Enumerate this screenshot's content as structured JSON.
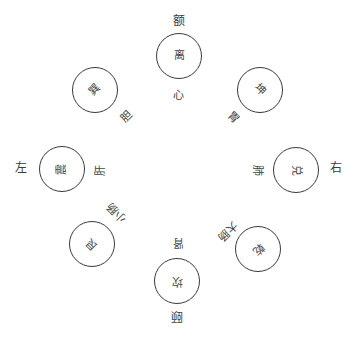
{
  "diagram": {
    "type": "bagua-organ-map",
    "line_color": "#3a3a3a",
    "text_color": "#444444",
    "trigrams": [
      {
        "id": "li",
        "label": "离",
        "position": "top",
        "x": 179,
        "y": 56,
        "rotation": 0
      },
      {
        "id": "kun",
        "label": "坤",
        "position": "top-right",
        "x": 260,
        "y": 90,
        "rotation": 45
      },
      {
        "id": "dui",
        "label": "兑",
        "position": "right",
        "x": 296,
        "y": 170,
        "rotation": 90
      },
      {
        "id": "qian",
        "label": "乾",
        "position": "bottom-right",
        "x": 258,
        "y": 249,
        "rotation": 135
      },
      {
        "id": "kan",
        "label": "坎",
        "position": "bottom",
        "x": 177,
        "y": 281,
        "rotation": 180
      },
      {
        "id": "gen",
        "label": "艮",
        "position": "bottom-left",
        "x": 92,
        "y": 244,
        "rotation": 225
      },
      {
        "id": "zhen",
        "label": "震",
        "position": "left",
        "x": 62,
        "y": 169,
        "rotation": 270
      },
      {
        "id": "xun",
        "label": "巽",
        "position": "top-left",
        "x": 95,
        "y": 90,
        "rotation": 315
      }
    ],
    "outer_labels": [
      {
        "id": "forehead",
        "label": "额",
        "x": 179,
        "y": 21,
        "rotation": 0
      },
      {
        "id": "chin",
        "label": "颐",
        "x": 177,
        "y": 316,
        "rotation": 180
      },
      {
        "id": "left",
        "label": "左",
        "x": 21,
        "y": 168,
        "rotation": 0
      },
      {
        "id": "right",
        "label": "右",
        "x": 336,
        "y": 168,
        "rotation": 0
      }
    ],
    "organ_labels": [
      {
        "id": "heart",
        "label": "心",
        "x": 178,
        "y": 96,
        "rotation": 0
      },
      {
        "id": "stomach",
        "label": "胃",
        "x": 233,
        "y": 118,
        "rotation": 45
      },
      {
        "id": "lung",
        "label": "肺",
        "x": 257,
        "y": 170,
        "rotation": 90
      },
      {
        "id": "large-intestine",
        "label": "大肠",
        "x": 227,
        "y": 231,
        "rotation": 135
      },
      {
        "id": "kidney",
        "label": "肾",
        "x": 178,
        "y": 242,
        "rotation": 180
      },
      {
        "id": "small-intestine",
        "label": "小肠",
        "x": 117,
        "y": 212,
        "rotation": 225
      },
      {
        "id": "liver",
        "label": "肝",
        "x": 101,
        "y": 170,
        "rotation": 270
      },
      {
        "id": "gallbladder",
        "label": "胆",
        "x": 127,
        "y": 117,
        "rotation": 315
      }
    ]
  }
}
